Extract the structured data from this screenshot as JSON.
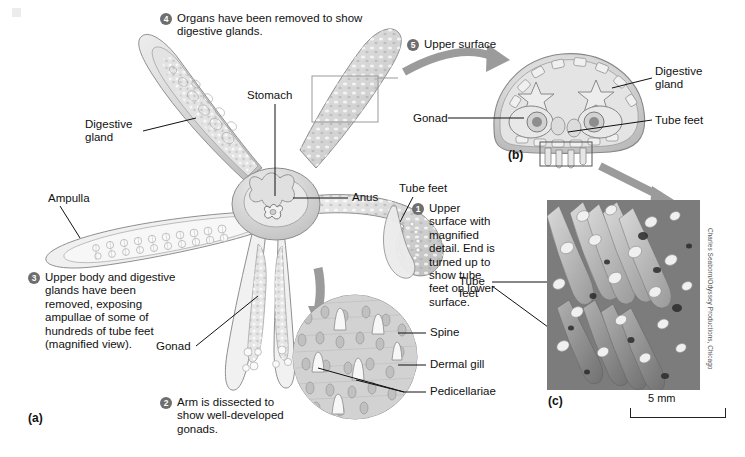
{
  "figure": {
    "panels": [
      {
        "id": "a",
        "label": "(a)"
      },
      {
        "id": "b",
        "label": "(b)"
      },
      {
        "id": "c",
        "label": "(c)"
      }
    ]
  },
  "callouts": [
    {
      "number": "1",
      "text": "Upper surface with magnified detail. End is turned up to show tube feet on lower surface."
    },
    {
      "number": "2",
      "text": "Arm is dissected to show well-developed gonads."
    },
    {
      "number": "3",
      "text": "Upper body and digestive glands have been removed, exposing ampullae of some of hundreds of tube feet (magnified view)."
    },
    {
      "number": "4",
      "text": "Organs have been removed to show digestive glands."
    },
    {
      "number": "5",
      "text": "Upper surface"
    }
  ],
  "labels": {
    "stomach": "Stomach",
    "digestive_gland_a": "Digestive gland",
    "ampulla": "Ampulla",
    "anus": "Anus",
    "tube_feet_a": "Tube feet",
    "gonad_a": "Gonad",
    "digestive_gland_b": "Digestive gland",
    "gonad_b": "Gonad",
    "tube_feet_b": "Tube feet",
    "spine": "Spine",
    "dermal_gill": "Dermal gill",
    "pedicellariae": "Pedicellariae",
    "tube_feet_c": "Tube feet"
  },
  "scale_bar": {
    "value": "5 mm"
  },
  "photo_credit": "Charles Seaborn/Odyssey Productions, Chicago",
  "colors": {
    "badge": "#6e6e6e",
    "arrow": "#9b9b9b",
    "leader": "#111111",
    "art_line": "#8f8f8f",
    "background": "#ffffff"
  }
}
